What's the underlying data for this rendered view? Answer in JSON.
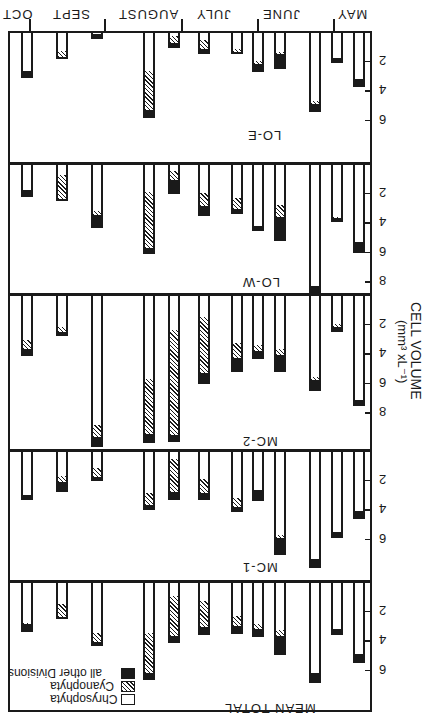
{
  "chart_data": {
    "type": "bar",
    "orientation_note_visible": "figure rendered upside down (rotated 180 degrees)",
    "ylabel": "CELL VOLUME (mm³ x L⁻¹)",
    "months": [
      "MAY",
      "JUNE",
      "JULY",
      "AUGUST",
      "SEPT",
      "OCT"
    ],
    "legend": [
      {
        "name": "Chrysophyta",
        "pattern": "white"
      },
      {
        "name": "Cyanophyta",
        "pattern": "hatched"
      },
      {
        "name": "all other Divisions",
        "pattern": "black"
      }
    ],
    "samples_per_panel": 12,
    "sample_months": [
      "MAY",
      "MAY",
      "JUNE",
      "JUNE",
      "JULY",
      "JULY",
      "JULY",
      "AUGUST",
      "AUGUST",
      "SEPT",
      "SEPT",
      "OCT"
    ],
    "panels": [
      {
        "name": "LO-E",
        "yticks": [
          2,
          4,
          6
        ],
        "bars": [
          {
            "chrysophyta": 3.1,
            "cyanophyta": 0.0,
            "other": 0.4
          },
          {
            "chrysophyta": 1.7,
            "cyanophyta": 0.0,
            "other": 0.2
          },
          {
            "chrysophyta": 4.6,
            "cyanophyta": 0.2,
            "other": 0.4
          },
          {
            "chrysophyta": 1.3,
            "cyanophyta": 0.1,
            "other": 0.9
          },
          {
            "chrysophyta": 1.9,
            "cyanophyta": 0.2,
            "other": 0.4
          },
          {
            "chrysophyta": 1.1,
            "cyanophyta": 0.2,
            "other": 0.0
          },
          {
            "chrysophyta": 0.5,
            "cyanophyta": 0.6,
            "other": 0.2
          },
          {
            "chrysophyta": 0.2,
            "cyanophyta": 0.5,
            "other": 0.2
          },
          {
            "chrysophyta": 2.6,
            "cyanophyta": 2.6,
            "other": 0.4
          },
          {
            "chrysophyta": 0.1,
            "cyanophyta": 0.0,
            "other": 0.2
          },
          {
            "chrysophyta": 1.2,
            "cyanophyta": 0.4,
            "other": 0.0
          },
          {
            "chrysophyta": 2.6,
            "cyanophyta": 0.0,
            "other": 0.3
          }
        ]
      },
      {
        "name": "LO-W",
        "yticks": [
          2,
          4,
          6,
          8
        ],
        "bars": [
          {
            "chrysophyta": 5.2,
            "cyanophyta": 0.0,
            "other": 0.6
          },
          {
            "chrysophyta": 3.5,
            "cyanophyta": 0.1,
            "other": 0.1
          },
          {
            "chrysophyta": 8.2,
            "cyanophyta": 0.0,
            "other": 0.4
          },
          {
            "chrysophyta": 2.7,
            "cyanophyta": 0.8,
            "other": 1.5
          },
          {
            "chrysophyta": 4.1,
            "cyanophyta": 0.0,
            "other": 0.2
          },
          {
            "chrysophyta": 2.2,
            "cyanophyta": 0.8,
            "other": 0.2
          },
          {
            "chrysophyta": 1.9,
            "cyanophyta": 0.9,
            "other": 0.5
          },
          {
            "chrysophyta": 0.4,
            "cyanophyta": 0.6,
            "other": 0.8
          },
          {
            "chrysophyta": 1.8,
            "cyanophyta": 3.8,
            "other": 0.3
          },
          {
            "chrysophyta": 3.1,
            "cyanophyta": 0.3,
            "other": 0.7
          },
          {
            "chrysophyta": 0.7,
            "cyanophyta": 1.6,
            "other": 0.0
          },
          {
            "chrysophyta": 1.7,
            "cyanophyta": 0.0,
            "other": 0.3
          }
        ]
      },
      {
        "name": "MC-2",
        "yticks": [
          2,
          4,
          6,
          8
        ],
        "bars": [
          {
            "chrysophyta": 7.0,
            "cyanophyta": 0.0,
            "other": 0.3
          },
          {
            "chrysophyta": 1.9,
            "cyanophyta": 0.2,
            "other": 0.2
          },
          {
            "chrysophyta": 5.5,
            "cyanophyta": 0.2,
            "other": 0.6
          },
          {
            "chrysophyta": 3.6,
            "cyanophyta": 0.4,
            "other": 1.0
          },
          {
            "chrysophyta": 3.3,
            "cyanophyta": 0.4,
            "other": 0.4
          },
          {
            "chrysophyta": 3.2,
            "cyanophyta": 1.0,
            "other": 0.8
          },
          {
            "chrysophyta": 1.4,
            "cyanophyta": 3.8,
            "other": 0.6
          },
          {
            "chrysophyta": 2.3,
            "cyanophyta": 7.1,
            "other": 0.3
          },
          {
            "chrysophyta": 5.6,
            "cyanophyta": 3.7,
            "other": 0.5
          },
          {
            "chrysophyta": 8.7,
            "cyanophyta": 0.8,
            "other": 0.6
          },
          {
            "chrysophyta": 2.1,
            "cyanophyta": 0.3,
            "other": 0.2
          },
          {
            "chrysophyta": 3.0,
            "cyanophyta": 0.6,
            "other": 0.3
          }
        ]
      },
      {
        "name": "MC-1",
        "yticks": [
          2,
          4,
          6
        ],
        "bars": [
          {
            "chrysophyta": 4.0,
            "cyanophyta": 0.0,
            "other": 0.4
          },
          {
            "chrysophyta": 5.4,
            "cyanophyta": 0.0,
            "other": 0.3
          },
          {
            "chrysophyta": 7.2,
            "cyanophyta": 0.0,
            "other": 0.5
          },
          {
            "chrysophyta": 5.6,
            "cyanophyta": 0.2,
            "other": 1.0
          },
          {
            "chrysophyta": 2.6,
            "cyanophyta": 0.0,
            "other": 0.6
          },
          {
            "chrysophyta": 3.1,
            "cyanophyta": 0.6,
            "other": 0.2
          },
          {
            "chrysophyta": 1.8,
            "cyanophyta": 1.0,
            "other": 0.3
          },
          {
            "chrysophyta": 0.5,
            "cyanophyta": 2.2,
            "other": 0.4
          },
          {
            "chrysophyta": 2.8,
            "cyanophyta": 0.8,
            "other": 0.2
          },
          {
            "chrysophyta": 1.1,
            "cyanophyta": 0.6,
            "other": 0.1
          },
          {
            "chrysophyta": 1.6,
            "cyanophyta": 0.4,
            "other": 0.6
          },
          {
            "chrysophyta": 2.9,
            "cyanophyta": 0.0,
            "other": 0.2
          }
        ]
      },
      {
        "name": "MEAN TOTAL",
        "yticks": [
          2,
          4,
          6
        ],
        "bars": [
          {
            "chrysophyta": 4.8,
            "cyanophyta": 0.0,
            "other": 0.5
          },
          {
            "chrysophyta": 3.1,
            "cyanophyta": 0.0,
            "other": 0.3
          },
          {
            "chrysophyta": 6.1,
            "cyanophyta": 0.0,
            "other": 0.5
          },
          {
            "chrysophyta": 3.2,
            "cyanophyta": 0.4,
            "other": 1.1
          },
          {
            "chrysophyta": 2.8,
            "cyanophyta": 0.3,
            "other": 0.4
          },
          {
            "chrysophyta": 2.2,
            "cyanophyta": 0.7,
            "other": 0.4
          },
          {
            "chrysophyta": 1.2,
            "cyanophyta": 1.8,
            "other": 0.4
          },
          {
            "chrysophyta": 0.9,
            "cyanophyta": 2.7,
            "other": 0.3
          },
          {
            "chrysophyta": 3.4,
            "cyanophyta": 2.7,
            "other": 0.3
          },
          {
            "chrysophyta": 3.4,
            "cyanophyta": 0.6,
            "other": 0.1
          },
          {
            "chrysophyta": 1.4,
            "cyanophyta": 0.9,
            "other": 0.0
          },
          {
            "chrysophyta": 2.7,
            "cyanophyta": 0.1,
            "other": 0.4
          }
        ]
      }
    ]
  },
  "labels": {
    "months": [
      "MAY",
      "JUNE",
      "JULY",
      "AUGUST",
      "SEPT",
      "OCT"
    ],
    "y_title_line1": "CELL VOLUME",
    "y_title_line2": "(mm³ xL⁻¹)",
    "legend_chrysophyta": "Chrysophyta",
    "legend_cyanophyta": "Cyanophyta",
    "legend_other": "all other Divisions"
  },
  "colors": {
    "ink": "#1a1a1a",
    "paper": "#ffffff"
  }
}
